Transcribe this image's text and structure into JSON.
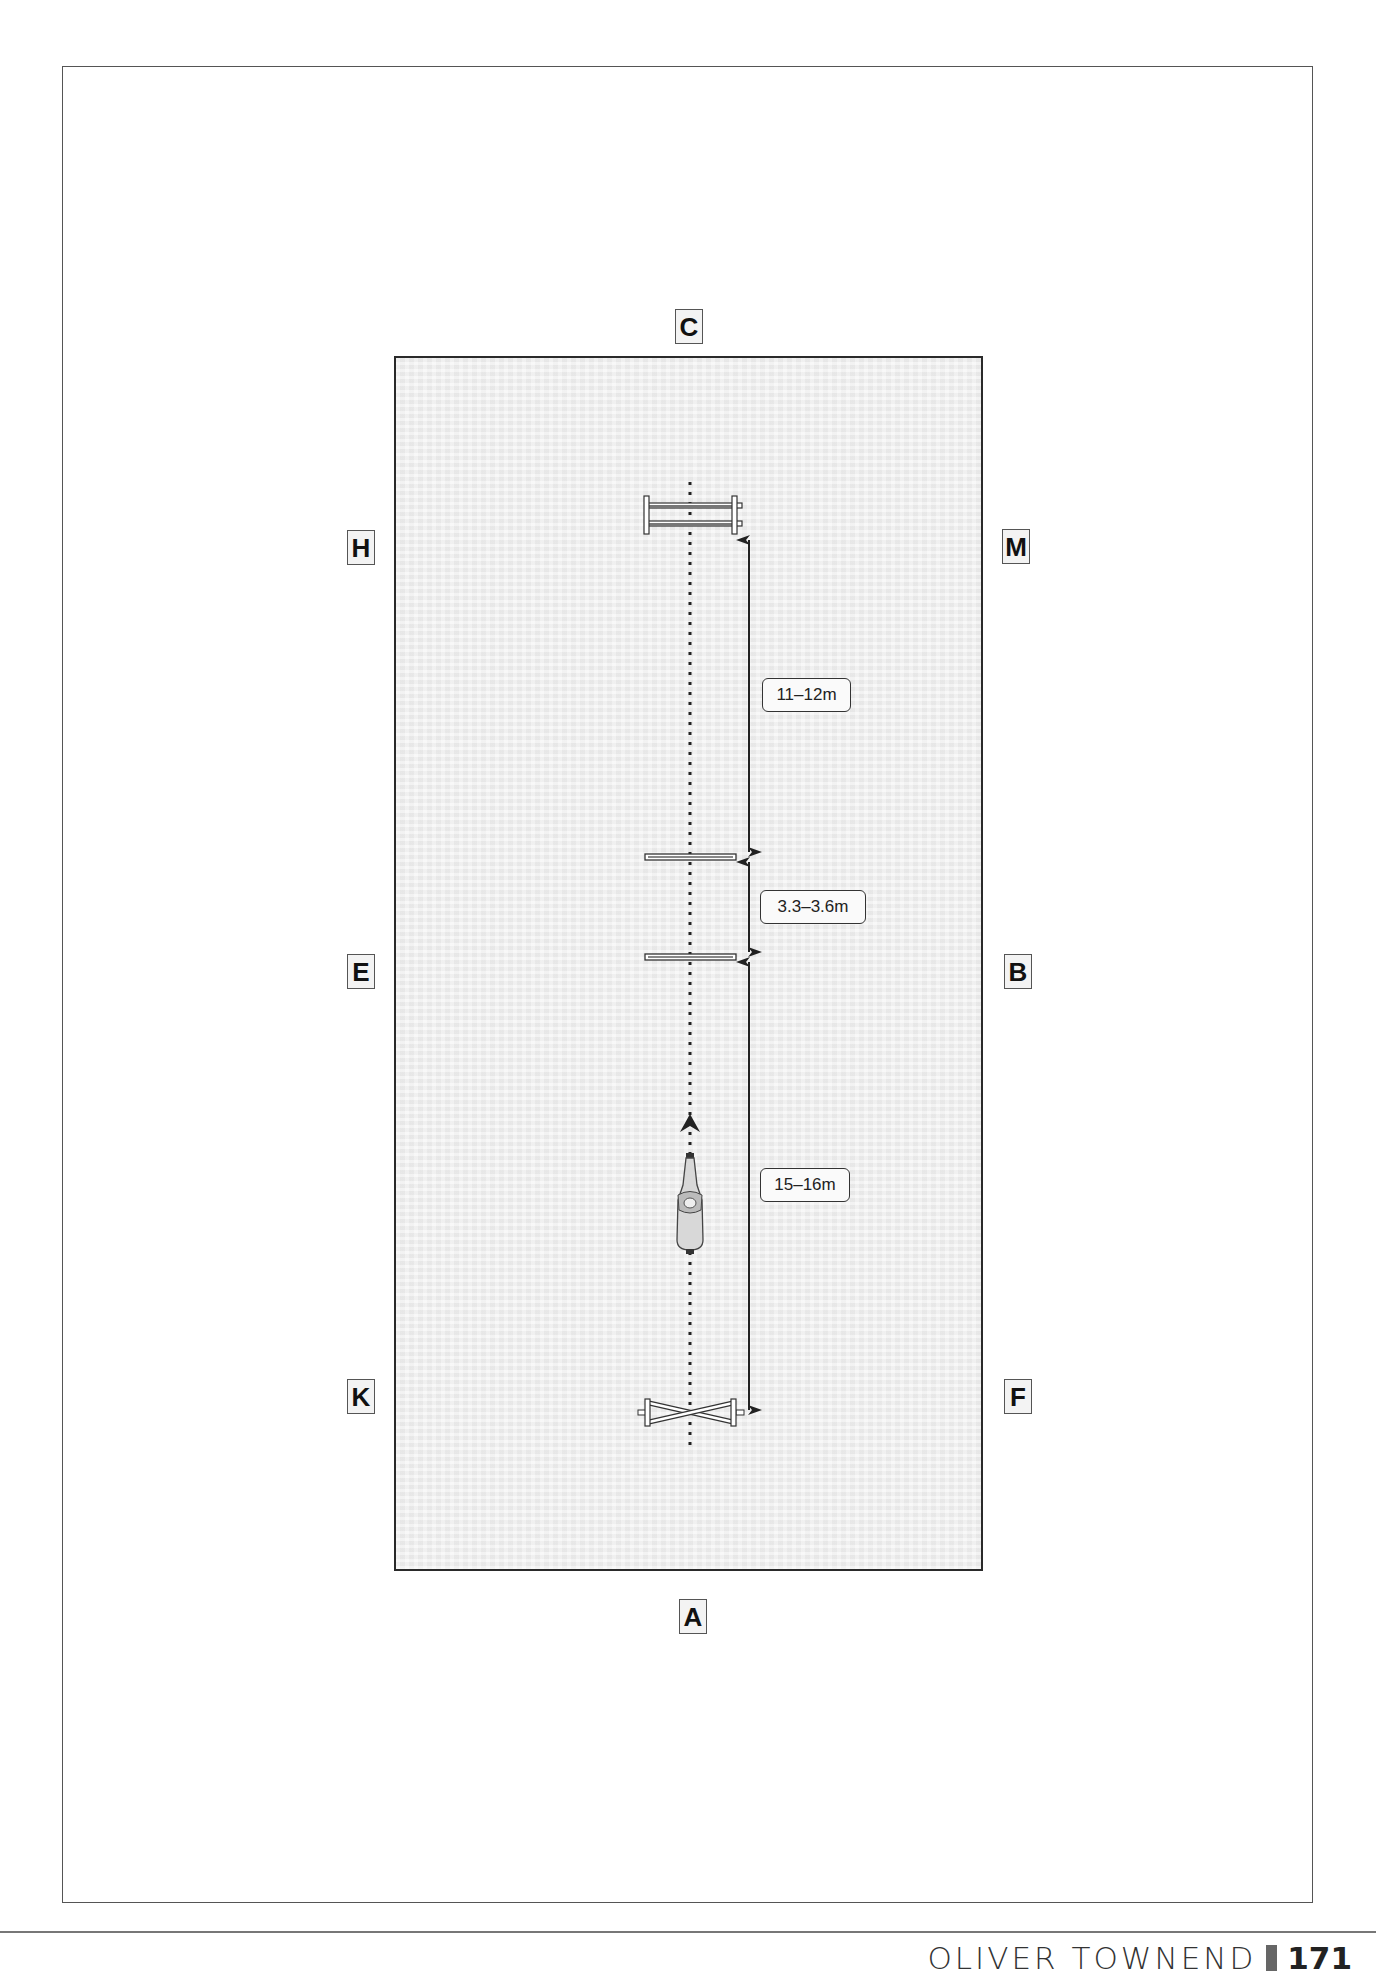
{
  "diagram": {
    "type": "arena-exercise-layout",
    "arena_markers": [
      {
        "id": "C",
        "label": "C",
        "position": "top-center"
      },
      {
        "id": "H",
        "label": "H",
        "position": "left-upper"
      },
      {
        "id": "M",
        "label": "M",
        "position": "right-upper"
      },
      {
        "id": "E",
        "label": "E",
        "position": "left-middle"
      },
      {
        "id": "B",
        "label": "B",
        "position": "right-middle"
      },
      {
        "id": "K",
        "label": "K",
        "position": "left-lower"
      },
      {
        "id": "F",
        "label": "F",
        "position": "right-lower"
      },
      {
        "id": "A",
        "label": "A",
        "position": "bottom-center"
      }
    ],
    "elements": [
      {
        "id": "oxer",
        "kind": "oxer-jump"
      },
      {
        "id": "pole-1",
        "kind": "ground-pole"
      },
      {
        "id": "pole-2",
        "kind": "ground-pole"
      },
      {
        "id": "cross-pole",
        "kind": "cross-pole-jump"
      },
      {
        "id": "horse-rider",
        "kind": "horse-and-rider",
        "direction": "up"
      }
    ],
    "distances": [
      {
        "label": "11–12m",
        "from": "pole-1",
        "to": "oxer"
      },
      {
        "label": "3.3–3.6m",
        "from": "pole-2",
        "to": "pole-1"
      },
      {
        "label": "15–16m",
        "from": "cross-pole",
        "to": "pole-2"
      }
    ],
    "colors": {
      "arena_fill": "#efefef",
      "line": "#222222"
    }
  },
  "footer": {
    "author": "OLIVER TOWNEND",
    "page_number": "171"
  }
}
